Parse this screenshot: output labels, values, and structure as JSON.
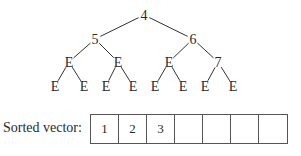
{
  "tree": {
    "nodes": [
      {
        "id": "n0",
        "label": "4",
        "x": 144,
        "y": 15
      },
      {
        "id": "n1",
        "label": "5",
        "x": 95,
        "y": 39
      },
      {
        "id": "n2",
        "label": "6",
        "x": 193,
        "y": 39
      },
      {
        "id": "n3",
        "label": "E",
        "x": 69,
        "y": 62
      },
      {
        "id": "n4",
        "label": "E",
        "x": 118,
        "y": 62
      },
      {
        "id": "n5",
        "label": "E",
        "x": 169,
        "y": 62
      },
      {
        "id": "n6",
        "label": "7",
        "x": 218,
        "y": 62
      },
      {
        "id": "n7",
        "label": "E",
        "x": 55,
        "y": 86
      },
      {
        "id": "n8",
        "label": "E",
        "x": 84,
        "y": 86
      },
      {
        "id": "n9",
        "label": "E",
        "x": 106,
        "y": 86
      },
      {
        "id": "n10",
        "label": "E",
        "x": 133,
        "y": 86
      },
      {
        "id": "n11",
        "label": "E",
        "x": 155,
        "y": 86
      },
      {
        "id": "n12",
        "label": "E",
        "x": 183,
        "y": 86
      },
      {
        "id": "n13",
        "label": "E",
        "x": 205,
        "y": 86
      },
      {
        "id": "n14",
        "label": "E",
        "x": 233,
        "y": 86
      }
    ],
    "edges": [
      [
        "n0",
        "n1"
      ],
      [
        "n0",
        "n2"
      ],
      [
        "n1",
        "n3"
      ],
      [
        "n1",
        "n4"
      ],
      [
        "n2",
        "n5"
      ],
      [
        "n2",
        "n6"
      ],
      [
        "n3",
        "n7"
      ],
      [
        "n3",
        "n8"
      ],
      [
        "n4",
        "n9"
      ],
      [
        "n4",
        "n10"
      ],
      [
        "n5",
        "n11"
      ],
      [
        "n5",
        "n12"
      ],
      [
        "n6",
        "n13"
      ],
      [
        "n6",
        "n14"
      ]
    ]
  },
  "vector": {
    "label": "Sorted vector:",
    "cells": [
      "1",
      "2",
      "3",
      "",
      "",
      "",
      ""
    ]
  }
}
